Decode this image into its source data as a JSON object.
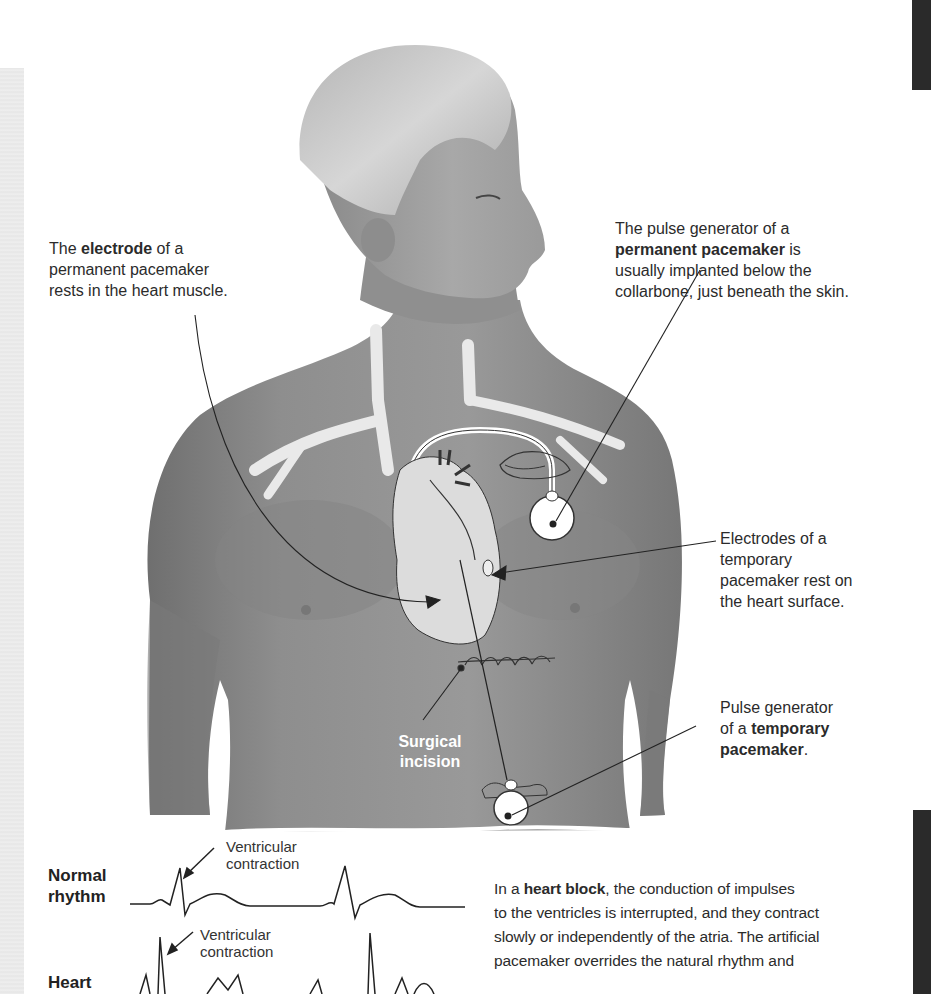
{
  "figure": {
    "colors": {
      "skin": "#8c8c8c",
      "skin_dark": "#6e6e6e",
      "hair": "#c8c8c8",
      "vessels": "#e8e8e8",
      "heart": "#dcdcdc",
      "outline": "#2a2a2a",
      "text": "#2b2b2b",
      "page_tab": "#2a2a2a"
    }
  },
  "labels": {
    "electrode": {
      "pre": "The ",
      "bold": "electrode",
      "post": " of a",
      "line2": "permanent pacemaker",
      "line3": "rests in the heart muscle."
    },
    "permanent_generator": {
      "line1": "The pulse generator of a",
      "bold": "permanent pacemaker",
      "post": " is",
      "line3": "usually implanted below the",
      "line4": "collarbone, just beneath the skin."
    },
    "temporary_electrodes": {
      "line1": "Electrodes of a",
      "line2": "temporary",
      "line3": "pacemaker rest on",
      "line4": "the heart surface."
    },
    "temporary_generator": {
      "line1": "Pulse generator",
      "pre": "of a ",
      "bold1": "temporary",
      "bold2": "pacemaker",
      "post": "."
    },
    "incision": {
      "line1": "Surgical",
      "line2": "incision"
    }
  },
  "ecg": {
    "normal": {
      "title_line1": "Normal",
      "title_line2": "rhythm",
      "annotation_line1": "Ventricular",
      "annotation_line2": "contraction"
    },
    "heart_block": {
      "title_line1": "Heart",
      "annotation_line1": "Ventricular",
      "annotation_line2": "contraction"
    }
  },
  "body_text": {
    "pre": "In a ",
    "bold": "heart block",
    "line1_post": ", the conduction of impulses",
    "line2": "to the ventricles is interrupted, and they contract",
    "line3": "slowly or independently of the atria. The artificial",
    "line4": "pacemaker overrides the natural rhythm and"
  }
}
